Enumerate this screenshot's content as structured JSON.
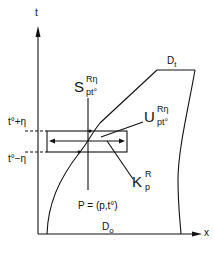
{
  "diagram": {
    "axes": {
      "vertical_label": "t",
      "horizontal_label": "x"
    },
    "ticks": {
      "upper": "t°+η",
      "lower": "t°−η"
    },
    "regions": {
      "top": "D",
      "top_sub": "t",
      "bottom": "D",
      "bottom_sub": "o"
    },
    "labels": {
      "S": {
        "main": "S",
        "sup": "Rη",
        "sub": "pt°"
      },
      "U": {
        "main": "U",
        "sup": "Rη",
        "sub": "pt°"
      },
      "K": {
        "main": "K",
        "sup": "R",
        "sub": "p"
      },
      "P": "P = (p,t°)"
    },
    "colors": {
      "ink": "#111111",
      "background": "#ffffff"
    }
  }
}
